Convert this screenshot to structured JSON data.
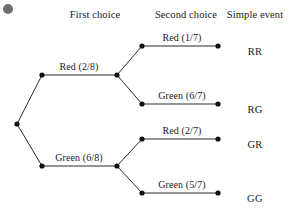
{
  "diagram": {
    "type": "probability-tree",
    "title": "",
    "headers": [
      {
        "label": "First choice",
        "x": 95,
        "y": 9
      },
      {
        "label": "Second choice",
        "x": 186,
        "y": 9
      },
      {
        "label": "Simple event",
        "x": 255,
        "y": 9
      }
    ],
    "bullet": {
      "name": "slide-bullet-dot",
      "cx": 8,
      "cy": 9,
      "r": 5,
      "color": "#6e6e6e"
    },
    "style": {
      "line_color": "#2b2b2b",
      "line_width": 1,
      "node_color": "#111111",
      "node_radius": 2.6,
      "text_color": "#1a1a1a"
    },
    "nodes": [
      {
        "name": "root-node",
        "id": "root",
        "x": 17,
        "y": 124
      },
      {
        "name": "first-choice-red-elbow-node",
        "id": "r_elbow",
        "x": 42,
        "y": 75
      },
      {
        "name": "first-choice-red-node",
        "id": "red1",
        "x": 117,
        "y": 75
      },
      {
        "name": "first-choice-green-elbow-node",
        "id": "g_elbow",
        "x": 42,
        "y": 166
      },
      {
        "name": "first-choice-green-node",
        "id": "green1",
        "x": 117,
        "y": 166
      },
      {
        "name": "second-choice-rr-elbow-node",
        "id": "rr_elbow",
        "x": 142,
        "y": 46
      },
      {
        "name": "second-choice-rr-end-node",
        "id": "rr_end",
        "x": 218,
        "y": 46
      },
      {
        "name": "second-choice-rg-elbow-node",
        "id": "rg_elbow",
        "x": 142,
        "y": 104
      },
      {
        "name": "second-choice-rg-end-node",
        "id": "rg_end",
        "x": 218,
        "y": 104
      },
      {
        "name": "second-choice-gr-elbow-node",
        "id": "gr_elbow",
        "x": 142,
        "y": 139
      },
      {
        "name": "second-choice-gr-end-node",
        "id": "gr_end",
        "x": 218,
        "y": 139
      },
      {
        "name": "second-choice-gg-elbow-node",
        "id": "gg_elbow",
        "x": 142,
        "y": 193
      },
      {
        "name": "second-choice-gg-end-node",
        "id": "gg_end",
        "x": 218,
        "y": 193
      }
    ],
    "edges": [
      {
        "name": "edge-root-to-red-elbow",
        "from": "root",
        "to": "r_elbow"
      },
      {
        "name": "edge-red-elbow-to-red",
        "from": "r_elbow",
        "to": "red1"
      },
      {
        "name": "edge-root-to-green-elbow",
        "from": "root",
        "to": "g_elbow"
      },
      {
        "name": "edge-green-elbow-to-green",
        "from": "g_elbow",
        "to": "green1"
      },
      {
        "name": "edge-red-to-rr-elbow",
        "from": "red1",
        "to": "rr_elbow"
      },
      {
        "name": "edge-rr-elbow-to-rr-end",
        "from": "rr_elbow",
        "to": "rr_end"
      },
      {
        "name": "edge-red-to-rg-elbow",
        "from": "red1",
        "to": "rg_elbow"
      },
      {
        "name": "edge-rg-elbow-to-rg-end",
        "from": "rg_elbow",
        "to": "rg_end"
      },
      {
        "name": "edge-green-to-gr-elbow",
        "from": "green1",
        "to": "gr_elbow"
      },
      {
        "name": "edge-gr-elbow-to-gr-end",
        "from": "gr_elbow",
        "to": "gr_end"
      },
      {
        "name": "edge-green-to-gg-elbow",
        "from": "green1",
        "to": "gg_elbow"
      },
      {
        "name": "edge-gg-elbow-to-gg-end",
        "from": "gg_elbow",
        "to": "gg_end"
      }
    ],
    "branch_labels": [
      {
        "name": "branch-label-first-red",
        "text": "Red (2/8)",
        "outcome": "Red",
        "probability": "2/8",
        "cx": 79,
        "y": 61
      },
      {
        "name": "branch-label-first-green",
        "text": "Green (6/8)",
        "outcome": "Green",
        "probability": "6/8",
        "cx": 79,
        "y": 152
      },
      {
        "name": "branch-label-second-red-1",
        "text": "Red (1/7)",
        "outcome": "Red",
        "probability": "1/7",
        "cx": 182,
        "y": 32
      },
      {
        "name": "branch-label-second-green-1",
        "text": "Green (6/7)",
        "outcome": "Green",
        "probability": "6/7",
        "cx": 182,
        "y": 90
      },
      {
        "name": "branch-label-second-red-2",
        "text": "Red (2/7)",
        "outcome": "Red",
        "probability": "2/7",
        "cx": 182,
        "y": 125
      },
      {
        "name": "branch-label-second-green-2",
        "text": "Green (5/7)",
        "outcome": "Green",
        "probability": "5/7",
        "cx": 182,
        "y": 179
      }
    ],
    "outcomes": [
      {
        "name": "simple-event-rr",
        "text": "RR",
        "cx": 255,
        "y": 46
      },
      {
        "name": "simple-event-rg",
        "text": "RG",
        "cx": 255,
        "y": 104
      },
      {
        "name": "simple-event-gr",
        "text": "GR",
        "cx": 255,
        "y": 139
      },
      {
        "name": "simple-event-gg",
        "text": "GG",
        "cx": 255,
        "y": 193
      }
    ]
  }
}
